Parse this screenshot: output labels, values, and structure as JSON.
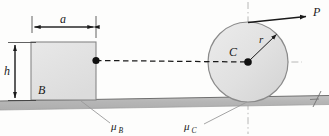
{
  "figure": {
    "labels": {
      "width_dimension": "a",
      "height_dimension": "h",
      "block": "B",
      "cylinder_center": "C",
      "radius": "r",
      "force": "P",
      "friction_block_symbol": "μ",
      "friction_block_sub": "B",
      "friction_cyl_symbol": "μ",
      "friction_cyl_sub": "C"
    },
    "colors": {
      "block_fill": "#e2e2e2",
      "block_stroke": "#8a8a8a",
      "cylinder_fill": "#e0e0e0",
      "cylinder_stroke": "#8d8d8d",
      "ground_fill": "#b9b9b9",
      "ground_stroke": "#7a7a7a",
      "line": "#1a1a1a",
      "centerline": "#9a9a9a",
      "background": "#fdfdfc"
    },
    "geometry": {
      "block": {
        "x": 31,
        "y": 42,
        "width": 65,
        "height": 57
      },
      "cylinder": {
        "cx": 248,
        "cy": 62,
        "r": 40
      },
      "dim_a_y": 27,
      "dim_h_x": 15,
      "ground_y_left": 101,
      "ground_y_right": 96,
      "ground_thickness": 9,
      "force_arrow": {
        "x1": 248,
        "y1": 22,
        "x2": 310,
        "y2": 17
      },
      "radius_arrow": {
        "x1": 248,
        "y1": 62,
        "x2": 277,
        "y2": 34
      },
      "link_dashed": {
        "x1": 96,
        "y1": 60,
        "x2": 248,
        "y2": 62
      }
    }
  }
}
